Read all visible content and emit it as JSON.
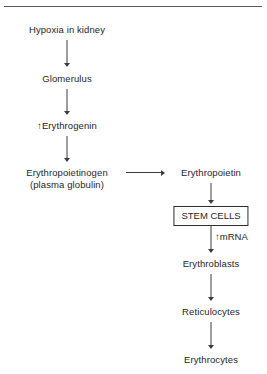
{
  "figure": {
    "type": "flowchart",
    "orientation": "vertical-two-column",
    "top_rule": true,
    "background_color": "#ffffff",
    "text_color": "#1f1f1f",
    "line_color": "#3c3c3c"
  },
  "nodes": {
    "hypoxia": {
      "label": "Hypoxia in kidney",
      "shape": "plain"
    },
    "glomerulus": {
      "label": "Glomerulus",
      "shape": "plain"
    },
    "erythrogenin": {
      "label": "↑Erythrogenin",
      "shape": "plain"
    },
    "erythropoietinogen": {
      "label": "Erythropoietinogen",
      "label_line2": "(plasma globulin)",
      "shape": "plain"
    },
    "erythropoietin": {
      "label": "Erythropoietin",
      "shape": "plain"
    },
    "stem_cells": {
      "label": "STEM CELLS",
      "shape": "box"
    },
    "erythroblasts": {
      "label": "Erythroblasts",
      "shape": "plain"
    },
    "reticulocytes": {
      "label": "Reticulocytes",
      "shape": "plain"
    },
    "erythrocytes": {
      "label": "Erythrocytes",
      "shape": "plain"
    }
  },
  "edge_labels": {
    "mrna": "↑mRNA"
  },
  "edges": [
    {
      "from": "hypoxia",
      "to": "glomerulus",
      "direction": "down"
    },
    {
      "from": "glomerulus",
      "to": "erythrogenin",
      "direction": "down"
    },
    {
      "from": "erythrogenin",
      "to": "erythropoietinogen",
      "direction": "down"
    },
    {
      "from": "erythropoietinogen",
      "to": "erythropoietin",
      "direction": "right"
    },
    {
      "from": "erythropoietin",
      "to": "stem_cells",
      "direction": "down"
    },
    {
      "from": "stem_cells",
      "to": "erythroblasts",
      "direction": "down",
      "label": "↑mRNA"
    },
    {
      "from": "erythroblasts",
      "to": "reticulocytes",
      "direction": "down"
    },
    {
      "from": "reticulocytes",
      "to": "erythrocytes",
      "direction": "down"
    }
  ]
}
